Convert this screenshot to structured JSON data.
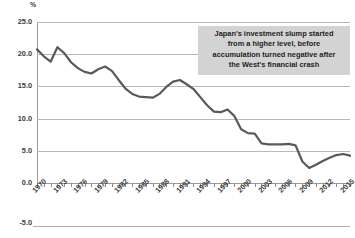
{
  "chart_data": {
    "type": "line",
    "title": "",
    "subtitle": "",
    "xlabel": "",
    "ylabel": "%",
    "unit_label": "%",
    "grid": true,
    "legend_position": "none",
    "ylim": [
      -5.0,
      25.0
    ],
    "ytick_labels": [
      "25.0",
      "20.0",
      "15.0",
      "10.0",
      "5.0",
      "0.0",
      "-5.0"
    ],
    "ytick_values": [
      25.0,
      20.0,
      15.0,
      10.0,
      5.0,
      0.0,
      -5.0
    ],
    "xlim": [
      1970,
      2016
    ],
    "xtick_labels": [
      "1970",
      "1973",
      "1976",
      "1979",
      "1982",
      "1985",
      "1988",
      "1991",
      "1994",
      "1997",
      "2000",
      "2003",
      "2006",
      "2009",
      "2012",
      "2015"
    ],
    "xtick_values": [
      1970,
      1973,
      1976,
      1979,
      1982,
      1985,
      1988,
      1991,
      1994,
      1997,
      2000,
      2003,
      2006,
      2009,
      2012,
      2015
    ],
    "series": [
      {
        "name": "Japan net capital accumulation",
        "color": "#595959",
        "x": [
          1970,
          1971,
          1972,
          1973,
          1974,
          1975,
          1976,
          1977,
          1978,
          1979,
          1980,
          1981,
          1982,
          1983,
          1984,
          1985,
          1986,
          1987,
          1988,
          1989,
          1990,
          1991,
          1992,
          1993,
          1994,
          1995,
          1996,
          1997,
          1998,
          1999,
          2000,
          2001,
          2002,
          2003,
          2004,
          2005,
          2006,
          2007,
          2008,
          2009,
          2010,
          2011,
          2012,
          2013,
          2014,
          2015,
          2016
        ],
        "values": [
          19.9,
          18.6,
          17.6,
          20.3,
          19.2,
          17.5,
          16.4,
          15.7,
          15.4,
          16.2,
          16.7,
          15.9,
          14.2,
          12.6,
          11.6,
          11.1,
          11.0,
          10.9,
          11.6,
          12.9,
          13.9,
          14.2,
          13.4,
          12.5,
          11.0,
          9.5,
          8.3,
          8.2,
          8.7,
          7.5,
          5.0,
          4.3,
          4.2,
          2.4,
          2.2,
          2.2,
          2.2,
          2.3,
          2.0,
          -1.0,
          -2.2,
          -1.6,
          -0.9,
          -0.3,
          0.2,
          0.4,
          0.1
        ]
      }
    ],
    "annotations": [
      {
        "name": "callout-text",
        "lines": [
          "Japan's investment slump started",
          "from a higher level, before",
          "accumulation turned negative after",
          "the West's financial crash"
        ],
        "background": "#d3d3d3"
      }
    ],
    "colors": {
      "line": "#595959",
      "gridline": "#b9b9b9",
      "axis": "#9a9a9a",
      "text": "#3b3b3b",
      "annotation_bg": "#d3d3d3"
    }
  },
  "footer": {
    "cropped_caption": ""
  }
}
